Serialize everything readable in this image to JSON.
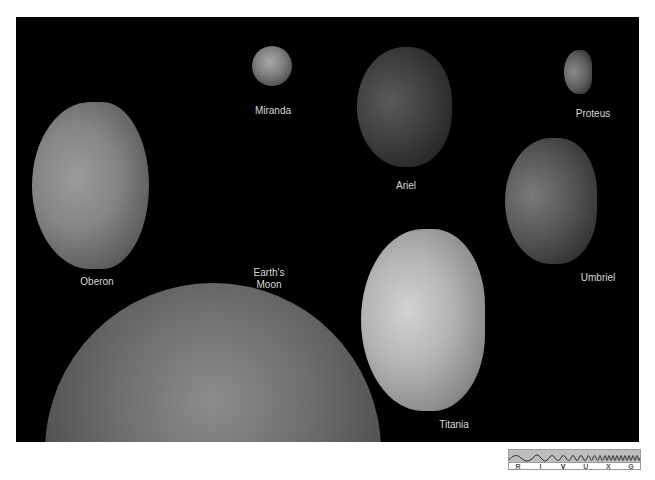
{
  "figure": {
    "background": "#000000",
    "moons": [
      {
        "id": "miranda",
        "label": "Miranda"
      },
      {
        "id": "ariel",
        "label": "Ariel"
      },
      {
        "id": "proteus",
        "label": "Proteus"
      },
      {
        "id": "oberon",
        "label": "Oberon"
      },
      {
        "id": "umbriel",
        "label": "Umbriel"
      },
      {
        "id": "earths-moon",
        "label": "Earth's\nMoon"
      },
      {
        "id": "titania",
        "label": "Titania"
      }
    ]
  },
  "spectrum_indicator": {
    "bands": [
      "R",
      "I",
      "V",
      "U",
      "X",
      "G"
    ],
    "active_band": "V"
  }
}
